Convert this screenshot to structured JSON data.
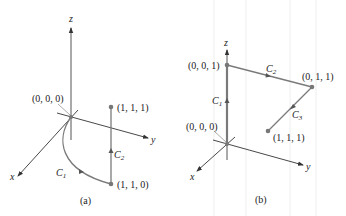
{
  "colors": {
    "axis": "#333333",
    "curve": "#7a7a7a",
    "point": "#777777",
    "text": "#222222"
  },
  "panels": [
    {
      "caption": "(a)",
      "axes": {
        "x": "x",
        "y": "y",
        "z": "z"
      },
      "points": [
        {
          "label": "(0, 0, 0)"
        },
        {
          "label": "(1, 1, 1)"
        },
        {
          "label": "(1, 1, 0)"
        }
      ],
      "curves": [
        {
          "name": "C",
          "sub": "1",
          "from": "(0, 0, 0)",
          "to": "(1, 1, 0)",
          "shape": "curved"
        },
        {
          "name": "C",
          "sub": "2",
          "from": "(1, 1, 0)",
          "to": "(1, 1, 1)",
          "shape": "segment"
        }
      ]
    },
    {
      "caption": "(b)",
      "axes": {
        "x": "x",
        "y": "y",
        "z": "z"
      },
      "points": [
        {
          "label": "(0, 0, 1)"
        },
        {
          "label": "(0, 1, 1)"
        },
        {
          "label": "(0, 0, 0)"
        },
        {
          "label": "(1, 1, 1)"
        }
      ],
      "curves": [
        {
          "name": "C",
          "sub": "1",
          "from": "(0, 0, 0)",
          "to": "(0, 0, 1)",
          "shape": "segment"
        },
        {
          "name": "C",
          "sub": "2",
          "from": "(0, 0, 1)",
          "to": "(0, 1, 1)",
          "shape": "segment"
        },
        {
          "name": "C",
          "sub": "3",
          "from": "(0, 1, 1)",
          "to": "(1, 1, 1)",
          "shape": "segment"
        }
      ]
    }
  ]
}
